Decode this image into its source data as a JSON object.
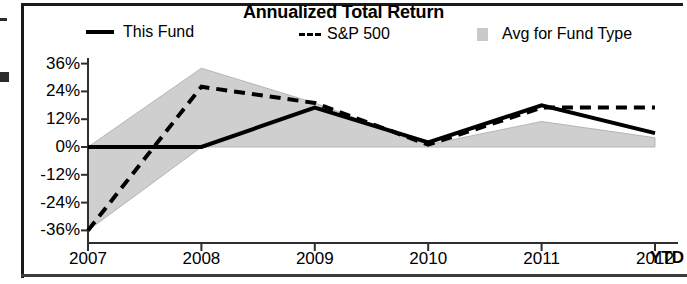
{
  "chart_data": {
    "type": "line",
    "title": "Annualized Total Return",
    "xlabel": "",
    "ylabel": "",
    "grid": false,
    "legend_position": "top",
    "x": [
      "2007",
      "2008",
      "2009",
      "2010",
      "2011",
      "2012"
    ],
    "x_note": "YTD",
    "ylim": [
      -36,
      36
    ],
    "yticks": [
      36,
      24,
      12,
      0,
      -12,
      -24,
      -36
    ],
    "ytick_labels": [
      "36%",
      "24%",
      "12%",
      "0%",
      "-12%",
      "-24%",
      "-36%"
    ],
    "xtick_labels": [
      "2007",
      "2008",
      "2009",
      "2010",
      "2011",
      "2012"
    ],
    "series": [
      {
        "name": "This Fund",
        "style": "solid",
        "color": "#000000",
        "values": [
          0,
          0,
          17,
          2,
          18,
          6
        ]
      },
      {
        "name": "S&P 500",
        "style": "dashed",
        "color": "#000000",
        "values": [
          -36,
          26,
          19,
          1,
          17,
          17
        ]
      }
    ],
    "band": {
      "name": "Avg for Fund Type",
      "style": "filled-area",
      "color": "#cfcfcf",
      "upper": [
        0,
        34,
        19,
        1,
        11,
        4
      ],
      "lower": [
        -36,
        0,
        0,
        0,
        0,
        0
      ]
    }
  },
  "header": {
    "title": "Annualized Total Return"
  },
  "legend": {
    "items": [
      {
        "label": "This Fund",
        "marker": "solid-line-swatch"
      },
      {
        "label": "S&P 500",
        "marker": "dashed-line-swatch"
      },
      {
        "label": "Avg for Fund Type",
        "marker": "shaded-band-swatch"
      }
    ]
  },
  "axes": {
    "y_labels": [
      "36%",
      "24%",
      "12%",
      "0%",
      "-12%",
      "-24%",
      "-36%"
    ],
    "x_labels": [
      "2007",
      "2008",
      "2009",
      "2010",
      "2011",
      "2012"
    ],
    "x_suffix": "YTD"
  }
}
